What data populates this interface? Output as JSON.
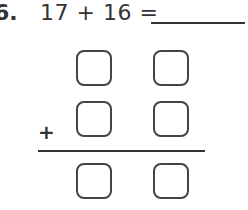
{
  "problem": {
    "number": "6.",
    "addend1": "17",
    "operator": "+",
    "addend2": "16",
    "equals": "=",
    "expression": "17  +  16  =",
    "answer_blank": ""
  },
  "vertical": {
    "operator": "+",
    "rows": [
      {
        "name": "addend-1",
        "boxes": [
          "",
          ""
        ]
      },
      {
        "name": "addend-2",
        "boxes": [
          "",
          ""
        ]
      },
      {
        "name": "sum",
        "boxes": [
          "",
          ""
        ]
      }
    ]
  }
}
